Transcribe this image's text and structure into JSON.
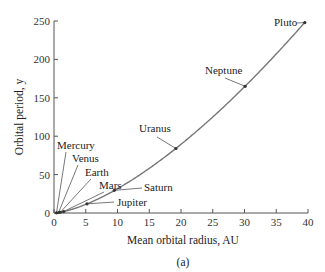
{
  "chart_data": {
    "type": "line",
    "title": "",
    "caption": "(a)",
    "xlabel": "Mean orbital radius, AU",
    "ylabel": "Orbital period, y",
    "xlim": [
      0,
      40
    ],
    "ylim": [
      0,
      250
    ],
    "xticks": [
      0,
      5,
      10,
      15,
      20,
      25,
      30,
      35,
      40
    ],
    "yticks": [
      0,
      50,
      100,
      150,
      200,
      250
    ],
    "grid": false,
    "legend": null,
    "series": [
      {
        "name": "Planets",
        "points": [
          {
            "label": "Mercury",
            "x": 0.39,
            "y": 0.24
          },
          {
            "label": "Venus",
            "x": 0.72,
            "y": 0.62
          },
          {
            "label": "Earth",
            "x": 1.0,
            "y": 1.0
          },
          {
            "label": "Mars",
            "x": 1.52,
            "y": 1.88
          },
          {
            "label": "Jupiter",
            "x": 5.2,
            "y": 11.9
          },
          {
            "label": "Saturn",
            "x": 9.5,
            "y": 29.5
          },
          {
            "label": "Uranus",
            "x": 19.2,
            "y": 84
          },
          {
            "label": "Neptune",
            "x": 30.1,
            "y": 165
          },
          {
            "label": "Pluto",
            "x": 39.5,
            "y": 248
          }
        ]
      }
    ]
  }
}
